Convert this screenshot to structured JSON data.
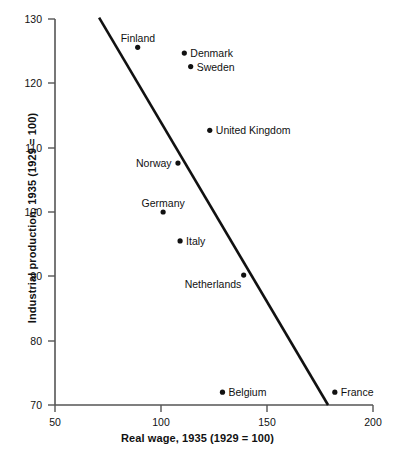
{
  "chart_data": {
    "type": "scatter",
    "title": "",
    "xlabel": "Real wage, 1935 (1929 = 100)",
    "ylabel": "Industrial production, 1935 (1929 = 100)",
    "xlim": [
      50,
      200
    ],
    "ylim": [
      70,
      130
    ],
    "xticks": [
      50,
      100,
      150,
      200
    ],
    "yticks": [
      70,
      80,
      90,
      100,
      110,
      120,
      130
    ],
    "xtick_labels": [
      "50",
      "100",
      "150",
      "200"
    ],
    "ytick_labels": [
      "70",
      "80",
      "90",
      "100",
      "110",
      "120",
      "130"
    ],
    "grid": false,
    "legend": null,
    "marker_color": "#111111",
    "line_color": "#111111",
    "points": [
      {
        "label": "Finland",
        "x": 89,
        "y": 125.6,
        "label_pos": "above"
      },
      {
        "label": "Denmark",
        "x": 111,
        "y": 124.7,
        "label_pos": "right"
      },
      {
        "label": "Sweden",
        "x": 114,
        "y": 122.6,
        "label_pos": "right"
      },
      {
        "label": "United Kingdom",
        "x": 123,
        "y": 112.7,
        "label_pos": "right"
      },
      {
        "label": "Norway",
        "x": 108,
        "y": 107.6,
        "label_pos": "left"
      },
      {
        "label": "Germany",
        "x": 101,
        "y": 100.0,
        "label_pos": "above"
      },
      {
        "label": "Italy",
        "x": 109,
        "y": 95.5,
        "label_pos": "right"
      },
      {
        "label": "Netherlands",
        "x": 139,
        "y": 90.2,
        "label_pos": "below-left"
      },
      {
        "label": "Belgium",
        "x": 129,
        "y": 72.0,
        "label_pos": "right"
      },
      {
        "label": "France",
        "x": 182,
        "y": 72.0,
        "label_pos": "right"
      }
    ],
    "trend_line": {
      "x_start": 70.8,
      "y_start": 130.2,
      "x_end": 178.8,
      "y_end": 70.0
    },
    "series_name": "European countries 1935"
  }
}
